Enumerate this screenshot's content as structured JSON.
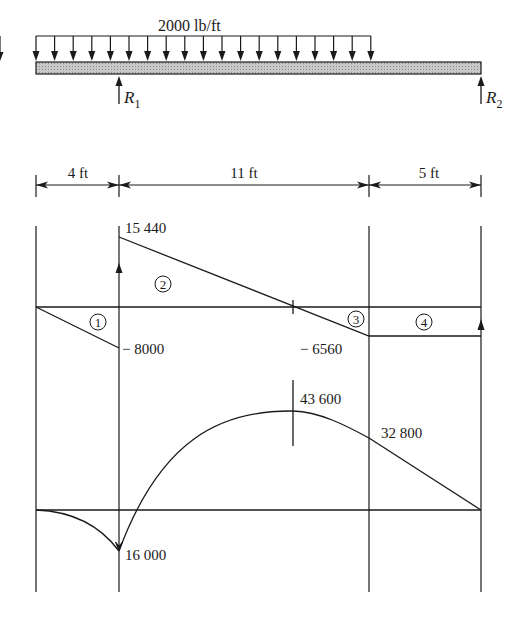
{
  "beam": {
    "load_label": "2000 lb/ft",
    "reactions": [
      {
        "label": "R",
        "sub": "1"
      },
      {
        "label": "R",
        "sub": "2"
      }
    ]
  },
  "dimensions": [
    {
      "label": "4 ft"
    },
    {
      "label": "11 ft"
    },
    {
      "label": "5 ft"
    }
  ],
  "shear_diagram": {
    "regions": [
      "1",
      "2",
      "3",
      "4"
    ],
    "values": {
      "v_left_support": "− 8000",
      "v_after_R1": "15 440",
      "v_at_load_end": "− 6560"
    }
  },
  "moment_diagram": {
    "values": {
      "m_at_R1": "16 000",
      "m_max": "43 600",
      "m_at_load_end": "32 800"
    }
  },
  "colors": {
    "line": "#1a1a1a",
    "beam_fill": "#bdbdbd"
  }
}
